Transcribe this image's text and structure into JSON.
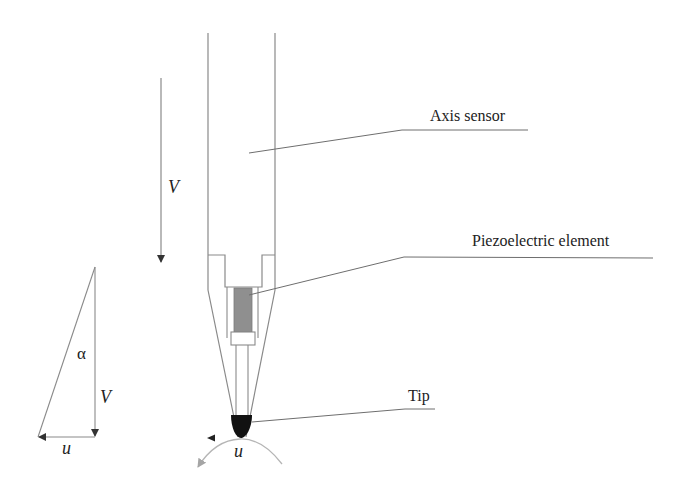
{
  "diagram": {
    "type": "probe-sensor-schematic",
    "callouts": {
      "axis_sensor": "Axis sensor",
      "piezoelectric_element": "Piezoelectric element",
      "tip": "Tip"
    },
    "symbols": {
      "velocity_main": "V",
      "velocity_triangle": "V",
      "angle": "α",
      "tangential_triangle": "u",
      "tangential_tip": "u"
    },
    "colors": {
      "line": "#8a8a8a",
      "leader": "#6e6e6e",
      "piezo_fill": "#8f8f8f",
      "tip_fill": "#111111",
      "arc": "#b5b5b5",
      "text": "#222222"
    }
  }
}
